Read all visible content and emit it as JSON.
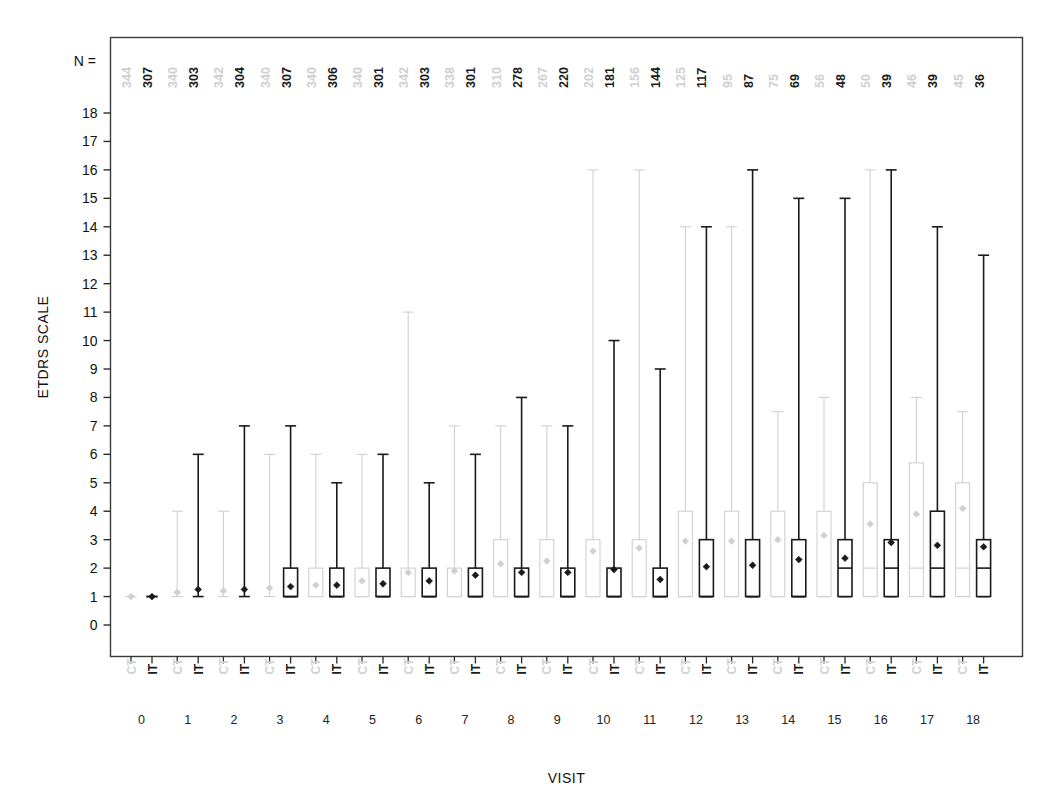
{
  "chart_data": {
    "type": "box",
    "title": "",
    "xlabel": "VISIT",
    "ylabel": "ETDRS SCALE",
    "ylim": [
      0,
      18
    ],
    "yticks": [
      0,
      1,
      2,
      3,
      4,
      5,
      6,
      7,
      8,
      9,
      10,
      11,
      12,
      13,
      14,
      15,
      16,
      17,
      18
    ],
    "grid": false,
    "legend_position": "none",
    "n_label": "N =",
    "group_axis_label": "VISIT",
    "categories": [
      "0",
      "1",
      "2",
      "3",
      "4",
      "5",
      "6",
      "7",
      "8",
      "9",
      "10",
      "11",
      "12",
      "13",
      "14",
      "15",
      "16",
      "17",
      "18"
    ],
    "subgroup_labels": [
      "CT",
      "IT"
    ],
    "colors": {
      "ct": "#d0d0d0",
      "it": "#1a1a1a",
      "frame": "#3a3a3a",
      "background": "#ffffff"
    },
    "series": [
      {
        "name": "CT",
        "color": "#d0d0d0",
        "n": [
          344,
          340,
          342,
          340,
          340,
          340,
          342,
          338,
          310,
          267,
          202,
          156,
          125,
          95,
          75,
          56,
          50,
          46,
          45
        ],
        "boxes": [
          {
            "visit": "0",
            "whisker_low": 1,
            "q1": 1,
            "median": 1,
            "q3": 1,
            "whisker_high": 1,
            "mean": 1.0
          },
          {
            "visit": "1",
            "whisker_low": 1,
            "q1": 1,
            "median": 1,
            "q3": 1,
            "whisker_high": 4,
            "mean": 1.15
          },
          {
            "visit": "2",
            "whisker_low": 1,
            "q1": 1,
            "median": 1,
            "q3": 1,
            "whisker_high": 4,
            "mean": 1.2
          },
          {
            "visit": "3",
            "whisker_low": 1,
            "q1": 1,
            "median": 1,
            "q3": 1,
            "whisker_high": 6,
            "mean": 1.3
          },
          {
            "visit": "4",
            "whisker_low": 1,
            "q1": 1,
            "median": 1,
            "q3": 2,
            "whisker_high": 6,
            "mean": 1.4
          },
          {
            "visit": "5",
            "whisker_low": 1,
            "q1": 1,
            "median": 1,
            "q3": 2,
            "whisker_high": 6,
            "mean": 1.55
          },
          {
            "visit": "6",
            "whisker_low": 1,
            "q1": 1,
            "median": 1,
            "q3": 2,
            "whisker_high": 11,
            "mean": 1.85
          },
          {
            "visit": "7",
            "whisker_low": 1,
            "q1": 1,
            "median": 1,
            "q3": 2,
            "whisker_high": 7,
            "mean": 1.9
          },
          {
            "visit": "8",
            "whisker_low": 1,
            "q1": 1,
            "median": 1,
            "q3": 3,
            "whisker_high": 7,
            "mean": 2.15
          },
          {
            "visit": "9",
            "whisker_low": 1,
            "q1": 1,
            "median": 1,
            "q3": 3,
            "whisker_high": 7,
            "mean": 2.25
          },
          {
            "visit": "10",
            "whisker_low": 1,
            "q1": 1,
            "median": 1,
            "q3": 3,
            "whisker_high": 16,
            "mean": 2.6
          },
          {
            "visit": "11",
            "whisker_low": 1,
            "q1": 1,
            "median": 1,
            "q3": 3,
            "whisker_high": 16,
            "mean": 2.7
          },
          {
            "visit": "12",
            "whisker_low": 1,
            "q1": 1,
            "median": 1,
            "q3": 4,
            "whisker_high": 14,
            "mean": 2.95
          },
          {
            "visit": "13",
            "visit_idx": 13,
            "whisker_low": 1,
            "q1": 1,
            "median": 1,
            "q3": 4,
            "whisker_high": 14,
            "mean": 2.95
          },
          {
            "visit": "14",
            "whisker_low": 1,
            "q1": 1,
            "median": 1,
            "q3": 4,
            "whisker_high": 7.5,
            "mean": 3.0
          },
          {
            "visit": "15",
            "whisker_low": 1,
            "q1": 1,
            "median": 1,
            "q3": 4,
            "whisker_high": 8,
            "mean": 3.15
          },
          {
            "visit": "16",
            "whisker_low": 1,
            "q1": 1,
            "median": 2,
            "q3": 5,
            "whisker_high": 16,
            "mean": 3.55
          },
          {
            "visit": "17",
            "whisker_low": 1,
            "q1": 1,
            "median": 2,
            "q3": 5.7,
            "whisker_high": 8,
            "mean": 3.9
          },
          {
            "visit": "18",
            "whisker_low": 1,
            "q1": 1,
            "median": 2,
            "q3": 5,
            "whisker_high": 7.5,
            "mean": 4.1
          }
        ]
      },
      {
        "name": "IT",
        "color": "#1a1a1a",
        "n": [
          307,
          303,
          304,
          307,
          306,
          301,
          303,
          301,
          278,
          220,
          181,
          144,
          117,
          87,
          69,
          48,
          39,
          39,
          36
        ],
        "boxes": [
          {
            "visit": "0",
            "whisker_low": 1,
            "q1": 1,
            "median": 1,
            "q3": 1,
            "whisker_high": 1,
            "mean": 1.0
          },
          {
            "visit": "1",
            "whisker_low": 1,
            "q1": 1,
            "median": 1,
            "q3": 1,
            "whisker_high": 6,
            "mean": 1.25
          },
          {
            "visit": "2",
            "whisker_low": 1,
            "q1": 1,
            "median": 1,
            "q3": 1,
            "whisker_high": 7,
            "mean": 1.25
          },
          {
            "visit": "3",
            "whisker_low": 1,
            "q1": 1,
            "median": 1,
            "q3": 2,
            "whisker_high": 7,
            "mean": 1.35
          },
          {
            "visit": "4",
            "whisker_low": 1,
            "q1": 1,
            "median": 1,
            "q3": 2,
            "whisker_high": 5,
            "mean": 1.4
          },
          {
            "visit": "5",
            "whisker_low": 1,
            "q1": 1,
            "median": 1,
            "q3": 2,
            "whisker_high": 6,
            "mean": 1.45
          },
          {
            "visit": "6",
            "whisker_low": 1,
            "q1": 1,
            "median": 1,
            "q3": 2,
            "whisker_high": 5,
            "mean": 1.55
          },
          {
            "visit": "7",
            "whisker_low": 1,
            "q1": 1,
            "median": 1,
            "q3": 2,
            "whisker_high": 6,
            "mean": 1.75
          },
          {
            "visit": "8",
            "whisker_low": 1,
            "q1": 1,
            "median": 1,
            "q3": 2,
            "whisker_high": 8,
            "mean": 1.85
          },
          {
            "visit": "9",
            "whisker_low": 1,
            "q1": 1,
            "median": 1,
            "q3": 2,
            "whisker_high": 7,
            "mean": 1.85
          },
          {
            "visit": "10",
            "whisker_low": 1,
            "q1": 1,
            "median": 1,
            "q3": 2,
            "whisker_high": 10,
            "mean": 1.95
          },
          {
            "visit": "11",
            "whisker_low": 1,
            "q1": 1,
            "median": 1,
            "q3": 2,
            "whisker_high": 9,
            "mean": 1.6
          },
          {
            "visit": "12",
            "whisker_low": 1,
            "q1": 1,
            "median": 1,
            "q3": 3,
            "whisker_high": 14,
            "mean": 2.05
          },
          {
            "visit": "13",
            "whisker_low": 1,
            "q1": 1,
            "median": 1,
            "q3": 3,
            "whisker_high": 16,
            "mean": 2.1
          },
          {
            "visit": "14",
            "whisker_low": 1,
            "q1": 1,
            "median": 1,
            "q3": 3,
            "whisker_high": 15,
            "mean": 2.3
          },
          {
            "visit": "15",
            "whisker_low": 1,
            "q1": 1,
            "median": 2,
            "q3": 3,
            "whisker_high": 15,
            "mean": 2.35
          },
          {
            "visit": "16",
            "whisker_low": 1,
            "q1": 1,
            "median": 2,
            "q3": 3,
            "whisker_high": 16,
            "mean": 2.9
          },
          {
            "visit": "17",
            "whisker_low": 1,
            "q1": 1,
            "median": 2,
            "q3": 4,
            "whisker_high": 14,
            "mean": 2.8
          },
          {
            "visit": "18",
            "whisker_low": 1,
            "q1": 1,
            "median": 2,
            "q3": 3,
            "whisker_high": 13,
            "mean": 2.75
          }
        ]
      }
    ]
  }
}
